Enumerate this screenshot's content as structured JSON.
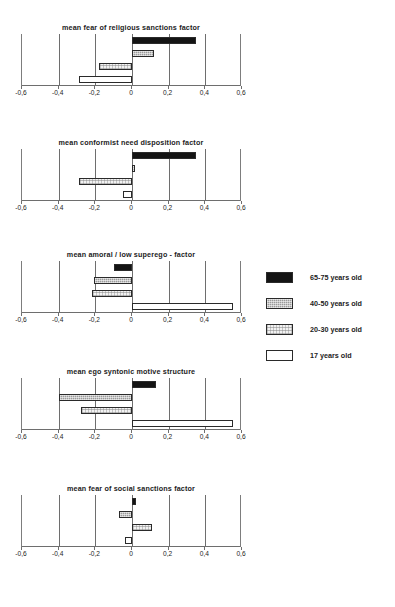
{
  "chart_data": [
    {
      "type": "bar",
      "orientation": "horizontal",
      "title": "mean fear of religious sanctions factor",
      "xlabel": "",
      "ylabel": "",
      "xlim": [
        -0.6,
        0.6
      ],
      "xticks": [
        -0.6,
        -0.4,
        -0.2,
        0,
        0.2,
        0.4,
        0.6
      ],
      "xticklabels": [
        "-0,6",
        "-0,4",
        "-0,2",
        "0",
        "0,2",
        "0,4",
        "0,6"
      ],
      "grid": true,
      "categories": [
        "65-75 years old",
        "40-50 years old",
        "20-30 years old",
        "17 years old"
      ],
      "values": [
        0.35,
        0.12,
        -0.18,
        -0.29
      ]
    },
    {
      "type": "bar",
      "orientation": "horizontal",
      "title": "mean conformist need disposition factor",
      "xlabel": "",
      "ylabel": "",
      "xlim": [
        -0.6,
        0.6
      ],
      "xticks": [
        -0.6,
        -0.4,
        -0.2,
        0,
        0.2,
        0.4,
        0.6
      ],
      "xticklabels": [
        "-0,6",
        "-0,4",
        "-0,2",
        "0",
        "0,2",
        "0,4",
        "0,6"
      ],
      "grid": true,
      "categories": [
        "65-75 years old",
        "40-50 years old",
        "20-30 years old",
        "17 years old"
      ],
      "values": [
        0.35,
        0.015,
        -0.29,
        -0.05
      ]
    },
    {
      "type": "bar",
      "orientation": "horizontal",
      "title": "mean amoral / low superego  - factor",
      "xlabel": "",
      "ylabel": "",
      "xlim": [
        -0.6,
        0.6
      ],
      "xticks": [
        -0.6,
        -0.4,
        -0.2,
        0,
        0.2,
        0.4,
        0.6
      ],
      "xticklabels": [
        "-0,6",
        "-0,4",
        "-0,2",
        "0",
        "0,2",
        "0,4",
        "0,6"
      ],
      "grid": true,
      "categories": [
        "65-75 years old",
        "40-50 years old",
        "20-30 years old",
        "17 years old"
      ],
      "values": [
        -0.1,
        -0.21,
        -0.22,
        0.55
      ]
    },
    {
      "type": "bar",
      "orientation": "horizontal",
      "title": "mean ego syntonic motive structure",
      "xlabel": "",
      "ylabel": "",
      "xlim": [
        -0.6,
        0.6
      ],
      "xticks": [
        -0.6,
        -0.4,
        -0.2,
        0,
        0.2,
        0.4,
        0.6
      ],
      "xticklabels": [
        "-0,6",
        "-0,4",
        "-0,2",
        "0",
        "0,2",
        "0,4",
        "0,6"
      ],
      "grid": true,
      "categories": [
        "65-75 years old",
        "40-50 years old",
        "20-30 years old",
        "17 years old"
      ],
      "values": [
        0.13,
        -0.4,
        -0.28,
        0.55
      ]
    },
    {
      "type": "bar",
      "orientation": "horizontal",
      "title": "mean fear of social sanctions factor",
      "xlabel": "",
      "ylabel": "",
      "xlim": [
        -0.6,
        0.6
      ],
      "xticks": [
        -0.6,
        -0.4,
        -0.2,
        0,
        0.2,
        0.4,
        0.6
      ],
      "xticklabels": [
        "-0,6",
        "-0,4",
        "-0,2",
        "0",
        "0,2",
        "0,4",
        "0,6"
      ],
      "grid": true,
      "categories": [
        "65-75 years old",
        "40-50 years old",
        "20-30 years old",
        "17 years old"
      ],
      "values": [
        0.02,
        -0.07,
        0.11,
        -0.04
      ]
    }
  ],
  "legend": {
    "position": "right",
    "items": [
      {
        "label": "65-75 years old",
        "fill": "solid-black",
        "color": "#141414"
      },
      {
        "label": "40-50 years old",
        "fill": "dotted-gray",
        "color": "#9a9a9a"
      },
      {
        "label": "20-30 years old",
        "fill": "light-hatch",
        "color": "#f2f2f2"
      },
      {
        "label": "17 years old",
        "fill": "white",
        "color": "#ffffff"
      }
    ]
  }
}
